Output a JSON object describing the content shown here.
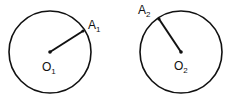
{
  "diagram": {
    "circles": [
      {
        "center_label": "O",
        "center_sub": "1",
        "point_label": "A",
        "point_sub": "1",
        "cx": 50,
        "cy": 52,
        "r": 41,
        "ax": 83,
        "ay": 31
      },
      {
        "center_label": "O",
        "center_sub": "2",
        "point_label": "A",
        "point_sub": "2",
        "cx": 181,
        "cy": 52,
        "r": 41,
        "ax": 159,
        "ay": 19
      }
    ],
    "stroke_color": "#111111",
    "background": "#ffffff"
  }
}
